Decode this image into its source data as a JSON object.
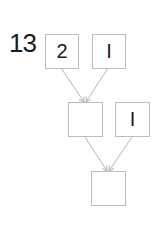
{
  "problem": {
    "number": "13"
  },
  "diagram": {
    "boxes": [
      {
        "id": "top-left",
        "value": "2"
      },
      {
        "id": "top-right",
        "value": "I"
      },
      {
        "id": "middle-left",
        "value": ""
      },
      {
        "id": "middle-right",
        "value": "I"
      },
      {
        "id": "bottom",
        "value": ""
      }
    ],
    "arrow_color": "#b5b5b5",
    "box_border_color": "#bdbdbd"
  }
}
